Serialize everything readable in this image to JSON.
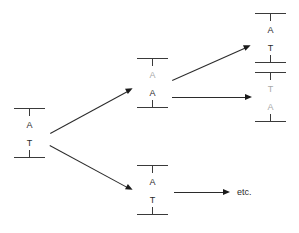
{
  "diagram": {
    "colors": {
      "stroke": "#3a3a3a",
      "text": "#2b2b2b",
      "faint_text": "#a9a9a9",
      "arrow": "#1a1a1a",
      "background": "#ffffff"
    },
    "duplexes": [
      {
        "id": "parent",
        "name": "parent-duplex",
        "top_base": "A",
        "bottom_base": "T",
        "top_faint": false,
        "bottom_faint": false
      },
      {
        "id": "mid-upper",
        "name": "mismatch-duplex",
        "top_base": "A",
        "bottom_base": "A",
        "top_faint": true,
        "bottom_faint": false
      },
      {
        "id": "mid-lower",
        "name": "normal-duplex",
        "top_base": "A",
        "bottom_base": "T",
        "top_faint": false,
        "bottom_faint": false
      },
      {
        "id": "right-upper",
        "name": "restored-duplex",
        "top_base": "A",
        "bottom_base": "T",
        "top_faint": false,
        "bottom_faint": false
      },
      {
        "id": "right-lower",
        "name": "mutated-duplex",
        "top_base": "T",
        "bottom_base": "A",
        "top_faint": true,
        "bottom_faint": true
      }
    ],
    "arrows": [
      {
        "id": "a1",
        "name": "arrow-parent-to-mismatch"
      },
      {
        "id": "a2",
        "name": "arrow-parent-to-normal"
      },
      {
        "id": "a3",
        "name": "arrow-mismatch-to-restored"
      },
      {
        "id": "a4",
        "name": "arrow-mismatch-to-mutated"
      },
      {
        "id": "a5",
        "name": "arrow-normal-to-etc"
      }
    ],
    "labels": {
      "etc": "etc."
    }
  }
}
